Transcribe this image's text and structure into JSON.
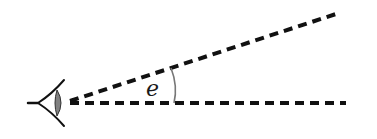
{
  "diagram": {
    "angle_label": "e",
    "colors": {
      "line": "#111111",
      "arc": "#777777",
      "lens": "#808080",
      "background": "#ffffff"
    },
    "elements": {
      "eye": "eye-icon",
      "upper_line": "dashed sight line (inclined)",
      "lower_line": "dashed sight line (horizontal)",
      "angle_arc": "arc marking angle e"
    }
  }
}
